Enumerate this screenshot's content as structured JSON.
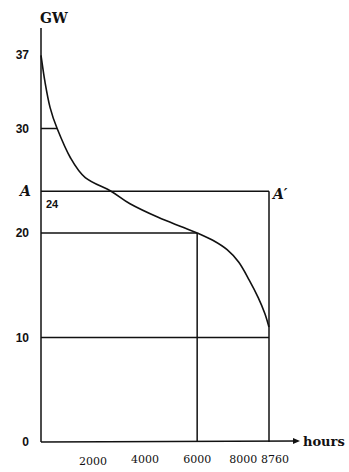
{
  "chart_data": {
    "type": "line",
    "title": "",
    "xlabel": "hours",
    "ylabel": "GW",
    "xlim": [
      0,
      8760
    ],
    "ylim": [
      0,
      38
    ],
    "grid": false,
    "x_ticks": [
      2000,
      4000,
      6000,
      8000,
      8760
    ],
    "x_tick_labels": [
      "2000",
      "4000",
      "6000",
      "8000",
      "8760"
    ],
    "y_ticks": [
      0,
      10,
      20,
      30,
      37
    ],
    "y_tick_labels": [
      "0",
      "10",
      "20",
      "30",
      "37"
    ],
    "series": [
      {
        "name": "load duration curve",
        "x": [
          0,
          150,
          350,
          620,
          1130,
          1700,
          2690,
          3420,
          4500,
          5400,
          6000,
          6600,
          7150,
          7600,
          8000,
          8350,
          8600,
          8760
        ],
        "y": [
          37,
          34.5,
          32,
          30,
          27.2,
          25.3,
          24,
          22.8,
          21.5,
          20.6,
          20,
          19.3,
          18.4,
          17.2,
          15.5,
          13.8,
          12.3,
          11
        ]
      }
    ],
    "reference_lines": [
      {
        "name": "horizontal-30",
        "y": 30,
        "x_from": 0,
        "x_to": 620
      },
      {
        "name": "horizontal-24",
        "y": 24,
        "x_from": 0,
        "x_to": 8760
      },
      {
        "name": "horizontal-20",
        "y": 20,
        "x_from": 0,
        "x_to": 6000
      },
      {
        "name": "horizontal-10",
        "y": 10,
        "x_from": 0,
        "x_to": 8760
      },
      {
        "name": "vertical-6000",
        "x": 6000,
        "y_from": 0,
        "y_to": 20
      },
      {
        "name": "vertical-8760",
        "x": 8760,
        "y_from": 0,
        "y_to": 24
      }
    ],
    "annotations": [
      {
        "text": "A",
        "x": 0,
        "y": 24,
        "position": "left"
      },
      {
        "text": "24",
        "x": 0,
        "y": 24,
        "position": "below-right"
      },
      {
        "text": "A′",
        "x": 8760,
        "y": 24,
        "position": "right"
      }
    ]
  }
}
